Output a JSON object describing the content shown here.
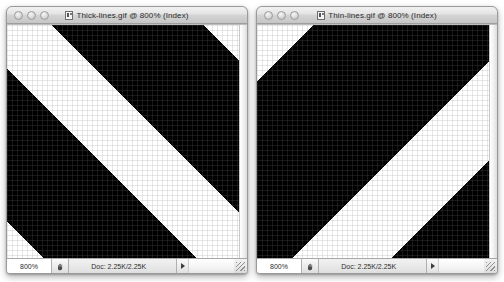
{
  "background_color": "#ffffff",
  "windows": [
    {
      "id": "thick-lines",
      "title": "Thick-lines.gif @ 800% (Index)",
      "proxy_icon": "document-image-icon",
      "traffic_lights": [
        {
          "name": "close-button",
          "label": "Close",
          "color": "#dcdcdc"
        },
        {
          "name": "minimize-button",
          "label": "Minimize",
          "color": "#dcdcdc"
        },
        {
          "name": "zoom-button",
          "label": "Zoom",
          "color": "#dcdcdc"
        }
      ],
      "statusbar": {
        "zoom_level": "800%",
        "grabber_icon": "hand-icon",
        "doc_info": "Doc: 2.25K/2.25K",
        "arrow_icon": "triangle-right-icon",
        "resize_grip_icon": "resize-grip-icon"
      },
      "image": {
        "description": "Thick black diagonal bands rising left-to-right over white, shown at 800% with pixel grid",
        "direction": "up-right",
        "angle_deg": 45,
        "band_color": "#000000",
        "gap_color": "#ffffff",
        "band_width_px": 108,
        "gap_width_px": 62,
        "period_px": 170,
        "phase_px": 26,
        "pixel_grid": true,
        "pixel_size_px": 5,
        "grid_color": "#808080"
      }
    },
    {
      "id": "thin-lines",
      "title": "Thin-lines.gif @ 800% (Index)",
      "proxy_icon": "document-image-icon",
      "traffic_lights": [
        {
          "name": "close-button",
          "label": "Close",
          "color": "#dcdcdc"
        },
        {
          "name": "minimize-button",
          "label": "Minimize",
          "color": "#dcdcdc"
        },
        {
          "name": "zoom-button",
          "label": "Zoom",
          "color": "#dcdcdc"
        }
      ],
      "statusbar": {
        "zoom_level": "800%",
        "grabber_icon": "hand-icon",
        "doc_info": "Doc: 2.25K/2.25K",
        "arrow_icon": "triangle-right-icon",
        "resize_grip_icon": "resize-grip-icon"
      },
      "image": {
        "description": "Black diagonal bands descending left-to-right over white with narrow white gaps, shown at 800% with pixel grid",
        "direction": "down-right",
        "angle_deg": -45,
        "band_color": "#000000",
        "gap_color": "#ffffff",
        "band_width_px": 150,
        "gap_width_px": 70,
        "period_px": 220,
        "phase_px": 40,
        "pixel_grid": true,
        "pixel_size_px": 5,
        "grid_color": "#808080"
      }
    }
  ]
}
